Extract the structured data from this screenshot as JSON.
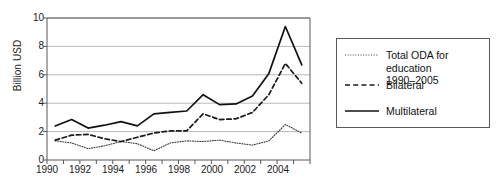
{
  "chart_data": {
    "type": "line",
    "title": "",
    "xlabel": "",
    "ylabel": "Billion USD",
    "xlim": [
      1990,
      2006
    ],
    "ylim": [
      0,
      10
    ],
    "yticks": [
      0,
      2,
      4,
      6,
      8,
      10
    ],
    "xticks": [
      1990,
      1992,
      1994,
      1996,
      1998,
      2000,
      2002,
      2004
    ],
    "minor_xticks_every": 1,
    "grid": "horizontal",
    "legend_position": "right",
    "x": [
      1990.5,
      1991.5,
      1992.5,
      1993.5,
      1994.5,
      1995.5,
      1996.5,
      1997.5,
      1998.5,
      1999.5,
      2000.5,
      2001.5,
      2002.5,
      2003.5,
      2004.5,
      2005.5
    ],
    "series": [
      {
        "name": "Total ODA for education 1990–2005",
        "style": "dotted",
        "color": "#3a3a3a",
        "values": [
          1.35,
          1.2,
          0.8,
          1.0,
          1.3,
          1.15,
          0.65,
          1.2,
          1.35,
          1.3,
          1.4,
          1.2,
          1.05,
          1.35,
          2.5,
          1.9
        ]
      },
      {
        "name": "Bilateral",
        "style": "dashed",
        "color": "#1a1a1a",
        "values": [
          1.4,
          1.75,
          1.8,
          1.5,
          1.3,
          1.6,
          1.9,
          2.05,
          2.05,
          3.25,
          2.85,
          2.9,
          3.35,
          4.6,
          6.8,
          5.4
        ]
      },
      {
        "name": "Multilateral",
        "style": "solid",
        "color": "#111111",
        "values": [
          2.4,
          2.85,
          2.25,
          2.45,
          2.7,
          2.4,
          3.25,
          3.35,
          3.45,
          4.6,
          3.9,
          3.95,
          4.5,
          6.1,
          9.4,
          6.7
        ]
      }
    ]
  },
  "legend": {
    "items": [
      {
        "label": "Total ODA for education\n1990–2005",
        "icon": "dotted-line-icon"
      },
      {
        "label": "Bilateral",
        "icon": "dashed-line-icon"
      },
      {
        "label": "Multilateral",
        "icon": "solid-line-icon"
      }
    ]
  },
  "axes": {
    "y_label": "Billion USD",
    "y_ticks": [
      "0",
      "2",
      "4",
      "6",
      "8",
      "10"
    ],
    "x_ticks": [
      "1990",
      "1992",
      "1994",
      "1996",
      "1998",
      "2000",
      "2002",
      "2004"
    ]
  },
  "colors": {
    "axis": "#595959",
    "grid": "#a6a6a6",
    "text": "#1a1a1a",
    "background": "#ffffff"
  }
}
